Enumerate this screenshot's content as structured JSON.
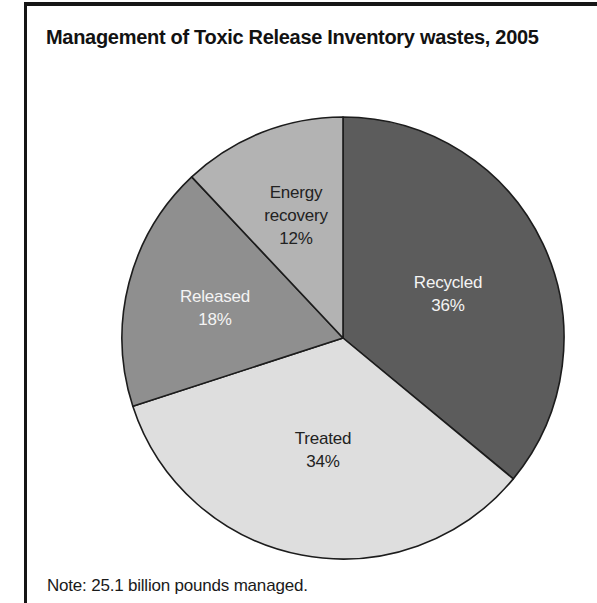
{
  "chart_data": {
    "type": "pie",
    "title": "Management of Toxic Release Inventory wastes, 2005",
    "note": "Note: 25.1 billion pounds managed.",
    "total_label": "25.1 billion pounds managed",
    "units": "percent",
    "direction": "clockwise",
    "start_angle": "12 o'clock",
    "legend": "labels-on-slices",
    "background_color": "#ffffff",
    "stroke_color": "#1c1c1c",
    "frame_color": "#161616",
    "slices": [
      {
        "label": "Recycled",
        "value": 36,
        "pct_text": "36%",
        "color": "#5c5c5c",
        "label_color": "#f4f4f4"
      },
      {
        "label": "Treated",
        "value": 34,
        "pct_text": "34%",
        "color": "#dedede",
        "label_color": "#222222"
      },
      {
        "label": "Released",
        "value": 18,
        "pct_text": "18%",
        "color": "#8f8f8f",
        "label_color": "#f4f4f4"
      },
      {
        "label": "Energy recovery",
        "value": 12,
        "pct_text": "12%",
        "color": "#b3b3b3",
        "label_color": "#222222"
      }
    ]
  }
}
